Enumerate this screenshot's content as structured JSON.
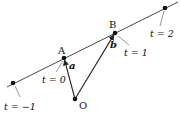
{
  "diagram": {
    "type": "vector-line-parametrization",
    "colors": {
      "stroke": "#222222",
      "background": "#ffffff"
    },
    "line": {
      "x1": 7,
      "y1": 87,
      "x2": 178,
      "y2": 2
    },
    "origin": {
      "name": "O",
      "x": 75,
      "y": 99,
      "label": "O",
      "label_x": 79,
      "label_y": 109
    },
    "points": [
      {
        "id": "p-minus1",
        "x": 13,
        "y": 83,
        "param_label": "t = −1",
        "param_x": 4,
        "param_y": 110,
        "pointer": {
          "x1": 15,
          "y1": 86,
          "x2": 20,
          "y2": 97
        }
      },
      {
        "id": "A",
        "name": "A",
        "x": 64,
        "y": 58,
        "name_x": 58,
        "name_y": 54,
        "param_label": "t = 0",
        "param_x": 42,
        "param_y": 83,
        "pointer": {
          "x1": 63,
          "y1": 61,
          "x2": 56,
          "y2": 72
        }
      },
      {
        "id": "B",
        "name": "B",
        "x": 115,
        "y": 33,
        "name_x": 109,
        "name_y": 28,
        "param_label": "t = 1",
        "param_x": 124,
        "param_y": 56,
        "pointer": {
          "x1": 118,
          "y1": 36,
          "x2": 129,
          "y2": 45
        }
      },
      {
        "id": "p-2",
        "x": 165,
        "y": 8,
        "param_label": "t = 2",
        "param_x": 150,
        "param_y": 37,
        "pointer": {
          "x1": 164,
          "y1": 11,
          "x2": 160,
          "y2": 26
        }
      }
    ],
    "vectors": [
      {
        "name": "a",
        "label": "a",
        "from": "O",
        "to": "A",
        "label_x": 69,
        "label_y": 69
      },
      {
        "name": "b",
        "label": "b",
        "from": "O",
        "to": "B",
        "label_x": 110,
        "label_y": 48
      }
    ]
  }
}
